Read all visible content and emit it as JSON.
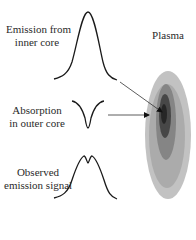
{
  "labels": {
    "emission_inner_line1": "Emission from",
    "emission_inner_line2": "inner core",
    "absorption_line1": "Absorption",
    "absorption_line2": "in outer core",
    "observed_line1": "Observed",
    "observed_line2": "emission signal",
    "plasma": "Plasma"
  },
  "colors": {
    "curve": "#1a1a1a",
    "arrow": "#333333",
    "plasma_outer": "#b5b5b5",
    "plasma_inner": "#6a6a6a",
    "plasma_core": "#2a2a2a"
  },
  "elements": {
    "curves": [
      "emission-profile",
      "absorption-profile",
      "observed-profile"
    ],
    "arrows": [
      "emission-to-plasma-arrow",
      "absorption-to-plasma-arrow"
    ],
    "plasma": "plasma-ellipse"
  }
}
